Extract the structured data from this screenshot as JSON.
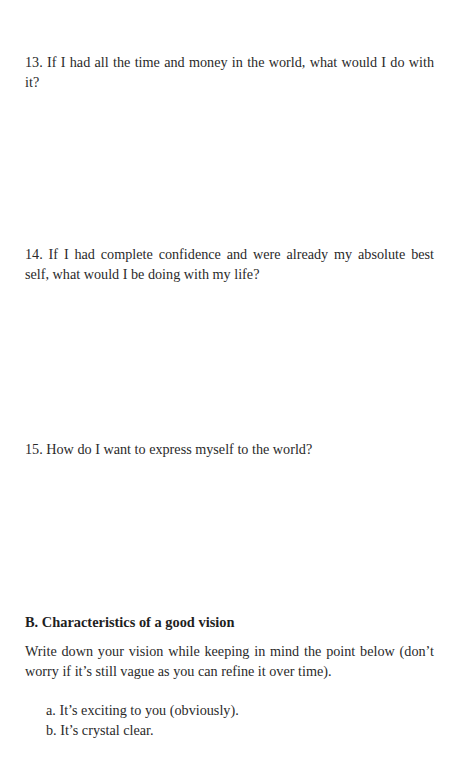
{
  "questions": [
    {
      "number": "13.",
      "text": "If I had all the time and money in the world, what would I do with it?"
    },
    {
      "number": "14.",
      "text": "If I had complete confidence and were already my absolute best self, what would I be doing with my life?"
    },
    {
      "number": "15.",
      "text": "How do I want to express myself to the world?"
    }
  ],
  "section_b": {
    "heading": "B. Characteristics of a good vision",
    "paragraph": "Write down your vision while keeping in mind the point below (don’t worry if it’s still vague as you can refine it over time).",
    "items": [
      {
        "marker": "a.",
        "text": "It’s exciting to you (obviously)."
      },
      {
        "marker": "b.",
        "text": "It’s crystal clear."
      }
    ]
  }
}
